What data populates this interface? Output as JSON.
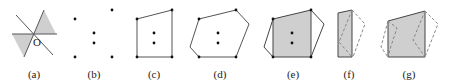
{
  "figure": {
    "type": "geometric-construction-sequence",
    "colors": {
      "shade": "#cfcfcf",
      "line": "#555555",
      "dashed": "#888888",
      "point": "#111111",
      "text": "#222222"
    },
    "panels": [
      {
        "id": "a",
        "label": "(a)",
        "origin_label": "O",
        "description": "three lines through origin O with two opposite shaded wedges"
      },
      {
        "id": "b",
        "label": "(b)",
        "description": "six points: four outer points and two inner points"
      },
      {
        "id": "c",
        "label": "(c)",
        "description": "quadrilateral through the four outer points, two inner points inside"
      },
      {
        "id": "d",
        "label": "(d)",
        "description": "hexagon enclosing the points, two inner points inside"
      },
      {
        "id": "e",
        "label": "(e)",
        "description": "shaded quadrilateral inside the hexagon with two inner points"
      },
      {
        "id": "f",
        "label": "(f)",
        "description": "thin shaded quadrilateral with dashed outline of folded parts"
      },
      {
        "id": "g",
        "label": "(g)",
        "description": "shaded quadrilateral with dashed outlines of folded parts on both sides"
      }
    ]
  }
}
